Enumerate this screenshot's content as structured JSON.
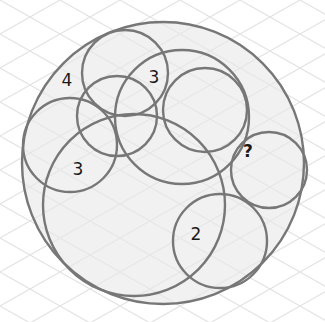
{
  "puzzle": {
    "background_color": "#ffffff",
    "grid_color": "#e4e4e4",
    "fill_color": "#f1f1f1",
    "stroke_color": "#777777",
    "outer_circle": {
      "cx": 163,
      "cy": 163,
      "r": 141
    },
    "circles": [
      {
        "id": "top-small",
        "cx": 125,
        "cy": 73,
        "r": 43
      },
      {
        "id": "middle-left-small",
        "cx": 117,
        "cy": 116,
        "r": 40
      },
      {
        "id": "large-upper",
        "cx": 182,
        "cy": 117,
        "r": 67
      },
      {
        "id": "right-upper",
        "cx": 205,
        "cy": 110,
        "r": 42
      },
      {
        "id": "left",
        "cx": 70,
        "cy": 145,
        "r": 47
      },
      {
        "id": "large-lower",
        "cx": 134,
        "cy": 205,
        "r": 91
      },
      {
        "id": "right-small",
        "cx": 269,
        "cy": 170,
        "r": 38
      },
      {
        "id": "bottom-right",
        "cx": 220,
        "cy": 241,
        "r": 47
      }
    ],
    "labels": [
      {
        "text": "4",
        "x": 67,
        "y": 86,
        "bold": false
      },
      {
        "text": "3",
        "x": 154,
        "y": 83,
        "bold": false
      },
      {
        "text": "3",
        "x": 78,
        "y": 175,
        "bold": false
      },
      {
        "text": "?",
        "x": 248,
        "y": 157,
        "bold": true
      },
      {
        "text": "2",
        "x": 196,
        "y": 240,
        "bold": false
      }
    ]
  }
}
